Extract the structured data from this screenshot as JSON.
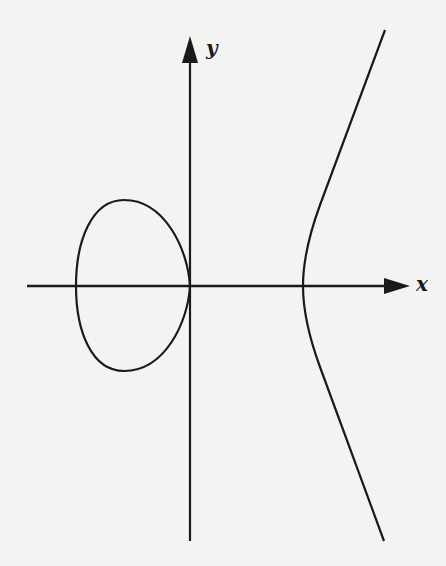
{
  "figure": {
    "type": "elliptic curve plot",
    "x_axis_label": "x",
    "y_axis_label": "y",
    "components": [
      "bounded oval (left of origin, touching y-axis at origin)",
      "unbounded branch (right, opening rightward)"
    ],
    "colors": {
      "background": "#f3f3f1",
      "ink": "#1a1a1a"
    }
  }
}
